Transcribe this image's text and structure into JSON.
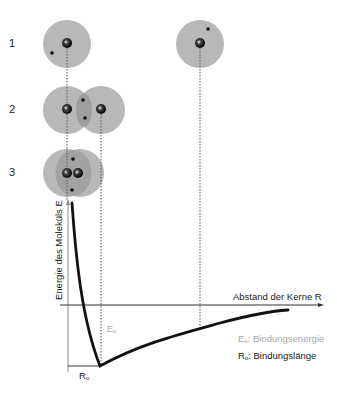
{
  "diagram": {
    "rows": [
      {
        "number": "1",
        "description": "two separate atoms far apart"
      },
      {
        "number": "2",
        "description": "electron clouds overlapping"
      },
      {
        "number": "3",
        "description": "atoms too close, nuclei repel"
      }
    ],
    "axes": {
      "y_label": "Energie des Moleküls E",
      "x_label": "Abstand der Kerne R"
    },
    "markers": {
      "energy_marker": "E",
      "energy_sub": "o",
      "length_marker": "R",
      "length_sub": "o"
    },
    "legend": [
      {
        "symbol": "E",
        "sub": "o",
        "text": ": Bindungsenergie",
        "color": "#a8a8a8"
      },
      {
        "symbol": "R",
        "sub": "o",
        "text": ": Bindungslänge",
        "color": "#1a1a1a"
      }
    ],
    "colors": {
      "cloud": "#b4b4b4",
      "cloud_overlap": "#9a9a9a",
      "curve": "#111111",
      "axis": "#333333",
      "guide": "#555555"
    }
  }
}
